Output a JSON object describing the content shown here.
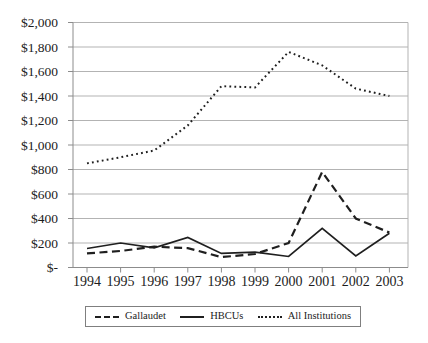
{
  "chart_data": {
    "type": "line",
    "title": "",
    "xlabel": "",
    "ylabel": "",
    "categories": [
      "1994",
      "1995",
      "1996",
      "1997",
      "1998",
      "1999",
      "2000",
      "2001",
      "2002",
      "2003"
    ],
    "series": [
      {
        "name": "Gallaudet",
        "style": "dashed",
        "values": [
          115,
          135,
          170,
          158,
          85,
          110,
          200,
          780,
          400,
          285
        ]
      },
      {
        "name": "HBCUs",
        "style": "solid",
        "values": [
          155,
          200,
          160,
          245,
          115,
          125,
          90,
          320,
          95,
          280
        ]
      },
      {
        "name": "All Institutions",
        "style": "dotted",
        "values": [
          850,
          900,
          955,
          1160,
          1480,
          1470,
          1760,
          1650,
          1460,
          1400
        ]
      }
    ],
    "ylim": [
      0,
      2000
    ],
    "ytick_step": 200,
    "ytick_labels": [
      "$-",
      "$200",
      "$400",
      "$600",
      "$800",
      "$1,000",
      "$1,200",
      "$1,400",
      "$1,600",
      "$1,800",
      "$2,000"
    ],
    "grid": true,
    "legend_position": "bottom"
  },
  "colors": {
    "line": "#1f1f1f",
    "grid": "#b3b3b3",
    "axis": "#8c8c8c",
    "text": "#1c1c1c",
    "background": "#ffffff"
  }
}
